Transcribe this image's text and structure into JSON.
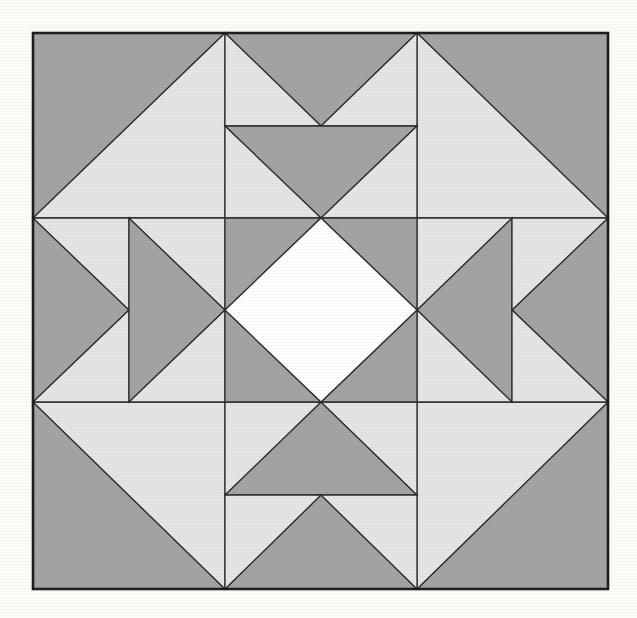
{
  "figure": {
    "kind": "quilt-block-pattern",
    "canvas": {
      "width": 637,
      "height": 618
    },
    "palette": {
      "background": "#fbfbf8",
      "dark": "#a3a3a3",
      "light": "#e4e4e4",
      "white": "#ffffff",
      "line": "#2e2e2e",
      "border": "#1e1e1e"
    },
    "stroke_width": {
      "piece": 1.3,
      "border": 2.6
    },
    "block": {
      "x": 33,
      "y": 33,
      "width": 575,
      "height": 556
    },
    "shapes": [
      {
        "name": "corner-top-left-dark-triangle",
        "fill": "dark",
        "points": [
          [
            33,
            33
          ],
          [
            225,
            33
          ],
          [
            33,
            218
          ]
        ]
      },
      {
        "name": "corner-top-left-light-triangle",
        "fill": "light",
        "points": [
          [
            225,
            33
          ],
          [
            225,
            218
          ],
          [
            33,
            218
          ]
        ]
      },
      {
        "name": "corner-top-right-dark-triangle",
        "fill": "dark",
        "points": [
          [
            417,
            33
          ],
          [
            608,
            33
          ],
          [
            608,
            218
          ]
        ]
      },
      {
        "name": "corner-top-right-light-triangle",
        "fill": "light",
        "points": [
          [
            417,
            33
          ],
          [
            417,
            218
          ],
          [
            608,
            218
          ]
        ]
      },
      {
        "name": "corner-bottom-left-dark-triangle",
        "fill": "dark",
        "points": [
          [
            33,
            402
          ],
          [
            33,
            589
          ],
          [
            225,
            589
          ]
        ]
      },
      {
        "name": "corner-bottom-left-light-triangle",
        "fill": "light",
        "points": [
          [
            33,
            402
          ],
          [
            225,
            402
          ],
          [
            225,
            589
          ]
        ]
      },
      {
        "name": "corner-bottom-right-dark-triangle",
        "fill": "dark",
        "points": [
          [
            608,
            402
          ],
          [
            608,
            589
          ],
          [
            417,
            589
          ]
        ]
      },
      {
        "name": "corner-bottom-right-light-triangle",
        "fill": "light",
        "points": [
          [
            417,
            402
          ],
          [
            608,
            402
          ],
          [
            417,
            589
          ]
        ]
      },
      {
        "name": "top-goose-1-dark-triangle",
        "fill": "dark",
        "points": [
          [
            225,
            33
          ],
          [
            417,
            33
          ],
          [
            321,
            126
          ]
        ]
      },
      {
        "name": "top-goose-1-left-light-triangle",
        "fill": "light",
        "points": [
          [
            225,
            33
          ],
          [
            321,
            126
          ],
          [
            225,
            126
          ]
        ]
      },
      {
        "name": "top-goose-1-right-light-triangle",
        "fill": "light",
        "points": [
          [
            417,
            33
          ],
          [
            417,
            126
          ],
          [
            321,
            126
          ]
        ]
      },
      {
        "name": "top-goose-2-dark-triangle",
        "fill": "dark",
        "points": [
          [
            225,
            126
          ],
          [
            417,
            126
          ],
          [
            321,
            218
          ]
        ]
      },
      {
        "name": "top-goose-2-left-light-triangle",
        "fill": "light",
        "points": [
          [
            225,
            126
          ],
          [
            321,
            218
          ],
          [
            225,
            218
          ]
        ]
      },
      {
        "name": "top-goose-2-right-light-triangle",
        "fill": "light",
        "points": [
          [
            417,
            126
          ],
          [
            417,
            218
          ],
          [
            321,
            218
          ]
        ]
      },
      {
        "name": "bottom-goose-1-dark-triangle",
        "fill": "dark",
        "points": [
          [
            321,
            402
          ],
          [
            417,
            495
          ],
          [
            225,
            495
          ]
        ]
      },
      {
        "name": "bottom-goose-1-left-light-triangle",
        "fill": "light",
        "points": [
          [
            225,
            402
          ],
          [
            321,
            402
          ],
          [
            225,
            495
          ]
        ]
      },
      {
        "name": "bottom-goose-1-right-light-triangle",
        "fill": "light",
        "points": [
          [
            321,
            402
          ],
          [
            417,
            402
          ],
          [
            417,
            495
          ]
        ]
      },
      {
        "name": "bottom-goose-2-dark-triangle",
        "fill": "dark",
        "points": [
          [
            321,
            495
          ],
          [
            417,
            589
          ],
          [
            225,
            589
          ]
        ]
      },
      {
        "name": "bottom-goose-2-left-light-triangle",
        "fill": "light",
        "points": [
          [
            225,
            495
          ],
          [
            321,
            495
          ],
          [
            225,
            589
          ]
        ]
      },
      {
        "name": "bottom-goose-2-right-light-triangle",
        "fill": "light",
        "points": [
          [
            321,
            495
          ],
          [
            417,
            495
          ],
          [
            417,
            589
          ]
        ]
      },
      {
        "name": "left-goose-1-dark-triangle",
        "fill": "dark",
        "points": [
          [
            33,
            218
          ],
          [
            129,
            310
          ],
          [
            33,
            402
          ]
        ]
      },
      {
        "name": "left-goose-1-top-light-triangle",
        "fill": "light",
        "points": [
          [
            33,
            218
          ],
          [
            129,
            218
          ],
          [
            129,
            310
          ]
        ]
      },
      {
        "name": "left-goose-1-bottom-light-triangle",
        "fill": "light",
        "points": [
          [
            129,
            310
          ],
          [
            129,
            402
          ],
          [
            33,
            402
          ]
        ]
      },
      {
        "name": "left-goose-2-dark-triangle",
        "fill": "dark",
        "points": [
          [
            129,
            218
          ],
          [
            225,
            310
          ],
          [
            129,
            402
          ]
        ]
      },
      {
        "name": "left-goose-2-top-light-triangle",
        "fill": "light",
        "points": [
          [
            129,
            218
          ],
          [
            225,
            218
          ],
          [
            225,
            310
          ]
        ]
      },
      {
        "name": "left-goose-2-bottom-light-triangle",
        "fill": "light",
        "points": [
          [
            225,
            310
          ],
          [
            225,
            402
          ],
          [
            129,
            402
          ]
        ]
      },
      {
        "name": "right-goose-1-dark-triangle",
        "fill": "dark",
        "points": [
          [
            512,
            218
          ],
          [
            512,
            402
          ],
          [
            417,
            310
          ]
        ]
      },
      {
        "name": "right-goose-1-top-light-triangle",
        "fill": "light",
        "points": [
          [
            417,
            218
          ],
          [
            512,
            218
          ],
          [
            417,
            310
          ]
        ]
      },
      {
        "name": "right-goose-1-bottom-light-triangle",
        "fill": "light",
        "points": [
          [
            417,
            310
          ],
          [
            512,
            402
          ],
          [
            417,
            402
          ]
        ]
      },
      {
        "name": "right-goose-2-dark-triangle",
        "fill": "dark",
        "points": [
          [
            608,
            218
          ],
          [
            608,
            402
          ],
          [
            512,
            310
          ]
        ]
      },
      {
        "name": "right-goose-2-top-light-triangle",
        "fill": "light",
        "points": [
          [
            512,
            218
          ],
          [
            608,
            218
          ],
          [
            512,
            310
          ]
        ]
      },
      {
        "name": "right-goose-2-bottom-light-triangle",
        "fill": "light",
        "points": [
          [
            512,
            310
          ],
          [
            608,
            402
          ],
          [
            512,
            402
          ]
        ]
      },
      {
        "name": "center-corner-top-left-dark-triangle",
        "fill": "dark",
        "points": [
          [
            225,
            218
          ],
          [
            321,
            218
          ],
          [
            225,
            310
          ]
        ]
      },
      {
        "name": "center-corner-top-right-dark-triangle",
        "fill": "dark",
        "points": [
          [
            321,
            218
          ],
          [
            417,
            218
          ],
          [
            417,
            310
          ]
        ]
      },
      {
        "name": "center-corner-bottom-right-dark-triangle",
        "fill": "dark",
        "points": [
          [
            417,
            310
          ],
          [
            417,
            402
          ],
          [
            321,
            402
          ]
        ]
      },
      {
        "name": "center-corner-bottom-left-dark-triangle",
        "fill": "dark",
        "points": [
          [
            225,
            310
          ],
          [
            321,
            402
          ],
          [
            225,
            402
          ]
        ]
      },
      {
        "name": "center-white-diamond",
        "fill": "white",
        "points": [
          [
            321,
            218
          ],
          [
            417,
            310
          ],
          [
            321,
            402
          ],
          [
            225,
            310
          ]
        ]
      }
    ]
  }
}
